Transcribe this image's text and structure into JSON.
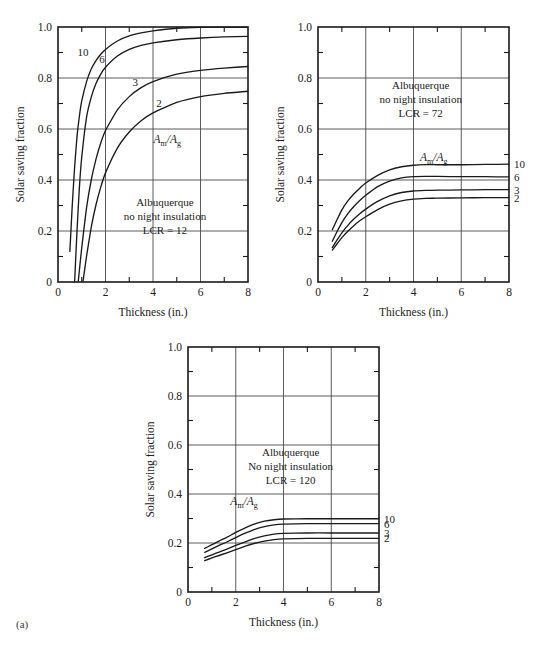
{
  "figure": {
    "label": "(a)",
    "panel_count": 3
  },
  "chart_data": [
    {
      "type": "line",
      "title": "",
      "xlabel": "Thickness (in.)",
      "ylabel": "Solar saving fraction",
      "xlim": [
        0,
        8
      ],
      "ylim": [
        0,
        1.0
      ],
      "xticks": [
        0,
        2,
        4,
        6,
        8
      ],
      "xtick_labels": [
        "0",
        "2",
        "4",
        "6",
        "8"
      ],
      "xminor": [
        1,
        3,
        5,
        7
      ],
      "yticks": [
        0,
        0.2,
        0.4,
        0.6,
        0.8,
        1.0
      ],
      "ytick_labels": [
        "0",
        "0.2",
        "0.4",
        "0.6",
        "0.8",
        "1.0"
      ],
      "yminor": [
        0.1,
        0.3,
        0.5,
        0.7,
        0.9
      ],
      "grid": true,
      "legend_position": "inline-labels",
      "annotation": [
        "Albuquerque",
        "no night insulation",
        "LCR = 12"
      ],
      "ratio_label": "Am/Ag",
      "series": [
        {
          "name": "10",
          "label": "10",
          "label_pos": "inline",
          "x": [
            0.5,
            0.6,
            0.7,
            0.8,
            0.9,
            1.0,
            1.2,
            1.4,
            1.6,
            1.8,
            2.0,
            2.5,
            3.0,
            3.5,
            4.0,
            5.0,
            6.0,
            7.0,
            8.0
          ],
          "values": [
            0.12,
            0.3,
            0.45,
            0.57,
            0.65,
            0.71,
            0.785,
            0.835,
            0.868,
            0.893,
            0.912,
            0.945,
            0.965,
            0.977,
            0.985,
            0.995,
            0.999,
            1.0,
            1.0
          ]
        },
        {
          "name": "6",
          "label": "6",
          "label_pos": "inline",
          "x": [
            0.7,
            0.8,
            0.9,
            1.0,
            1.2,
            1.4,
            1.6,
            1.8,
            2.0,
            2.5,
            3.0,
            3.5,
            4.0,
            5.0,
            6.0,
            7.0,
            8.0
          ],
          "values": [
            0.0,
            0.2,
            0.37,
            0.49,
            0.645,
            0.725,
            0.778,
            0.815,
            0.842,
            0.886,
            0.912,
            0.928,
            0.938,
            0.95,
            0.957,
            0.961,
            0.963
          ]
        },
        {
          "name": "3",
          "label": "3",
          "label_pos": "inline",
          "x": [
            0.85,
            1.0,
            1.2,
            1.4,
            1.6,
            1.8,
            2.0,
            2.5,
            3.0,
            3.5,
            4.0,
            5.0,
            6.0,
            7.0,
            8.0
          ],
          "values": [
            0.0,
            0.135,
            0.29,
            0.4,
            0.482,
            0.545,
            0.594,
            0.675,
            0.727,
            0.762,
            0.786,
            0.815,
            0.83,
            0.839,
            0.845
          ]
        },
        {
          "name": "2",
          "label": "2",
          "label_pos": "inline",
          "x": [
            1.05,
            1.2,
            1.4,
            1.6,
            1.8,
            2.0,
            2.5,
            3.0,
            3.5,
            4.0,
            5.0,
            6.0,
            7.0,
            8.0
          ],
          "values": [
            0.0,
            0.1,
            0.215,
            0.303,
            0.372,
            0.428,
            0.525,
            0.588,
            0.632,
            0.663,
            0.704,
            0.727,
            0.74,
            0.748
          ]
        }
      ]
    },
    {
      "type": "line",
      "title": "",
      "xlabel": "Thickness (in.)",
      "ylabel": "Solar saving fraction",
      "xlim": [
        0,
        8
      ],
      "ylim": [
        0,
        1.0
      ],
      "xticks": [
        0,
        2,
        4,
        6,
        8
      ],
      "xtick_labels": [
        "0",
        "2",
        "4",
        "6",
        "8"
      ],
      "xminor": [
        1,
        3,
        5,
        7
      ],
      "yticks": [
        0,
        0.2,
        0.4,
        0.6,
        0.8,
        1.0
      ],
      "ytick_labels": [
        "0",
        "0.2",
        "0.4",
        "0.6",
        "0.8",
        "1.0"
      ],
      "yminor": [
        0.1,
        0.3,
        0.5,
        0.7,
        0.9
      ],
      "grid": true,
      "legend_position": "right-edge",
      "annotation": [
        "Albuquerque",
        "no night insulation",
        "LCR = 72"
      ],
      "ratio_label": "Am/Ag",
      "series": [
        {
          "name": "10",
          "label": "10",
          "label_pos": "right",
          "x": [
            0.6,
            0.8,
            1.0,
            1.25,
            1.5,
            1.75,
            2.0,
            2.5,
            3.0,
            3.5,
            4.0,
            4.5,
            5.0,
            6.0,
            7.0,
            8.0
          ],
          "values": [
            0.205,
            0.245,
            0.283,
            0.318,
            0.345,
            0.368,
            0.388,
            0.418,
            0.44,
            0.452,
            0.458,
            0.46,
            0.46,
            0.46,
            0.461,
            0.462
          ]
        },
        {
          "name": "6",
          "label": "6",
          "label_pos": "right",
          "x": [
            0.6,
            0.8,
            1.0,
            1.25,
            1.5,
            1.75,
            2.0,
            2.5,
            3.0,
            3.5,
            4.0,
            4.5,
            5.0,
            6.0,
            7.0,
            8.0
          ],
          "values": [
            0.16,
            0.198,
            0.233,
            0.268,
            0.296,
            0.32,
            0.34,
            0.374,
            0.396,
            0.408,
            0.413,
            0.414,
            0.414,
            0.413,
            0.413,
            0.412
          ]
        },
        {
          "name": "3",
          "label": "3",
          "label_pos": "right",
          "x": [
            0.6,
            0.8,
            1.0,
            1.25,
            1.5,
            1.75,
            2.0,
            2.5,
            3.0,
            3.5,
            4.0,
            4.5,
            5.0,
            6.0,
            7.0,
            8.0
          ],
          "values": [
            0.135,
            0.165,
            0.193,
            0.222,
            0.247,
            0.268,
            0.286,
            0.316,
            0.338,
            0.351,
            0.357,
            0.359,
            0.36,
            0.361,
            0.362,
            0.362
          ]
        },
        {
          "name": "2",
          "label": "2",
          "label_pos": "right",
          "x": [
            0.6,
            0.8,
            1.0,
            1.25,
            1.5,
            1.75,
            2.0,
            2.5,
            3.0,
            3.5,
            4.0,
            4.5,
            5.0,
            6.0,
            7.0,
            8.0
          ],
          "values": [
            0.125,
            0.15,
            0.174,
            0.199,
            0.221,
            0.24,
            0.256,
            0.284,
            0.305,
            0.318,
            0.325,
            0.328,
            0.329,
            0.33,
            0.331,
            0.331
          ]
        }
      ]
    },
    {
      "type": "line",
      "title": "",
      "xlabel": "Thickness (in.)",
      "ylabel": "Solar saving fraction",
      "xlim": [
        0,
        8
      ],
      "ylim": [
        0,
        1.0
      ],
      "xticks": [
        0,
        2,
        4,
        6,
        8
      ],
      "xtick_labels": [
        "0",
        "2",
        "4",
        "6",
        "8"
      ],
      "xminor": [
        1,
        3,
        5,
        7
      ],
      "yticks": [
        0,
        0.2,
        0.4,
        0.6,
        0.8,
        1.0
      ],
      "ytick_labels": [
        "0",
        "0.2",
        "0.4",
        "0.6",
        "0.8",
        "1.0"
      ],
      "yminor": [
        0.1,
        0.3,
        0.5,
        0.7,
        0.9
      ],
      "grid": true,
      "legend_position": "right-edge",
      "annotation": [
        "Albuquerque",
        "No night insulation",
        "LCR = 120"
      ],
      "ratio_label": "Am/Ag",
      "series": [
        {
          "name": "10",
          "label": "10",
          "label_pos": "right",
          "x": [
            0.7,
            1.0,
            1.3,
            1.6,
            2.0,
            2.4,
            2.8,
            3.2,
            3.6,
            4.0,
            5.0,
            6.0,
            7.0,
            8.0
          ],
          "values": [
            0.178,
            0.193,
            0.208,
            0.222,
            0.243,
            0.262,
            0.278,
            0.289,
            0.295,
            0.298,
            0.299,
            0.299,
            0.299,
            0.299
          ]
        },
        {
          "name": "6",
          "label": "6",
          "label_pos": "right",
          "x": [
            0.7,
            1.0,
            1.3,
            1.6,
            2.0,
            2.4,
            2.8,
            3.2,
            3.6,
            4.0,
            5.0,
            6.0,
            7.0,
            8.0
          ],
          "values": [
            0.162,
            0.176,
            0.19,
            0.203,
            0.222,
            0.24,
            0.256,
            0.267,
            0.274,
            0.277,
            0.279,
            0.279,
            0.279,
            0.279
          ]
        },
        {
          "name": "3",
          "label": "3",
          "label_pos": "right",
          "x": [
            0.7,
            1.0,
            1.3,
            1.6,
            2.0,
            2.4,
            2.8,
            3.2,
            3.6,
            4.0,
            5.0,
            6.0,
            7.0,
            8.0
          ],
          "values": [
            0.14,
            0.152,
            0.163,
            0.174,
            0.19,
            0.205,
            0.219,
            0.229,
            0.236,
            0.239,
            0.241,
            0.241,
            0.241,
            0.241
          ]
        },
        {
          "name": "2",
          "label": "2",
          "label_pos": "right",
          "x": [
            0.7,
            1.0,
            1.3,
            1.6,
            2.0,
            2.4,
            2.8,
            3.2,
            3.6,
            4.0,
            5.0,
            6.0,
            7.0,
            8.0
          ],
          "values": [
            0.128,
            0.139,
            0.149,
            0.159,
            0.173,
            0.187,
            0.199,
            0.208,
            0.214,
            0.217,
            0.219,
            0.219,
            0.219,
            0.219
          ]
        }
      ]
    }
  ]
}
